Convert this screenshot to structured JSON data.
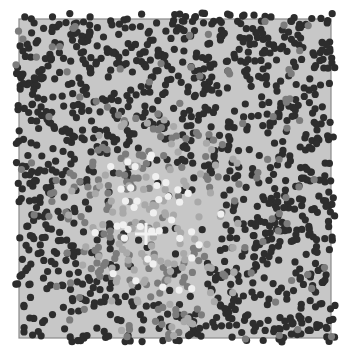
{
  "chart_data": {
    "type": "scatter",
    "title": "",
    "xlabel": "",
    "ylabel": "",
    "grid": false,
    "legend": null,
    "frame": {
      "x": 19,
      "y": 19,
      "width": 312,
      "height": 319
    },
    "background": "#c7c7c7",
    "frame_color": "#8a8a8a",
    "dot_radius": 3.6,
    "center_marker": {
      "shape": "cross",
      "x": 146,
      "y": 234,
      "size": 11,
      "color": "#f2f2f2"
    },
    "classes": [
      {
        "name": "dark",
        "color": "#2d2d2d",
        "description": "dense background points across whole field, sparser near center"
      },
      {
        "name": "mid-gray",
        "color": "#7c7c7c",
        "description": "ring around center region"
      },
      {
        "name": "light-gray",
        "color": "#a9a9a9",
        "description": "central cluster"
      },
      {
        "name": "white",
        "color": "#f0f0f0",
        "description": "core points near center"
      }
    ],
    "cluster_center": {
      "x": 150,
      "y": 225,
      "radius": 105
    },
    "approx_point_count": 2600,
    "seed": 7
  }
}
